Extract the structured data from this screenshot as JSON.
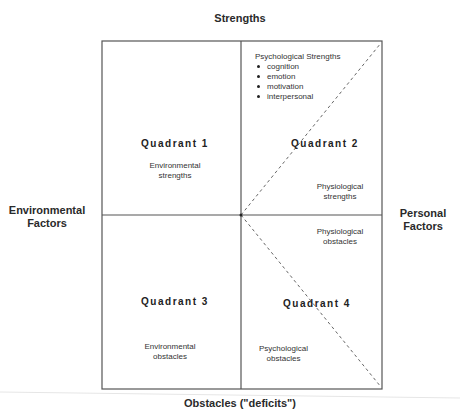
{
  "axes": {
    "top": "Strengths",
    "bottom": "Obstacles (\"deficits\")",
    "left": [
      "Environmental",
      "Factors"
    ],
    "right": [
      "Personal",
      "Factors"
    ]
  },
  "quadrants": [
    {
      "title": "Quadrant 1",
      "labels": [
        [
          "Environmental",
          "strengths"
        ]
      ]
    },
    {
      "title": "Quadrant 2",
      "labels": [
        [
          "Physiological",
          "strengths"
        ]
      ],
      "list_heading": "Psychological Strengths",
      "list_items": [
        "cognition",
        "emotion",
        "motivation",
        "interpersonal"
      ]
    },
    {
      "title": "Quadrant 3",
      "labels": [
        [
          "Environmental",
          "obstacles"
        ]
      ]
    },
    {
      "title": "Quadrant 4",
      "labels": [
        [
          "Physiological",
          "obstacles"
        ],
        [
          "Psychological",
          "obstacles"
        ]
      ]
    }
  ],
  "colors": {
    "border": "#555555",
    "dashed": "#666666",
    "text": "#222222"
  }
}
